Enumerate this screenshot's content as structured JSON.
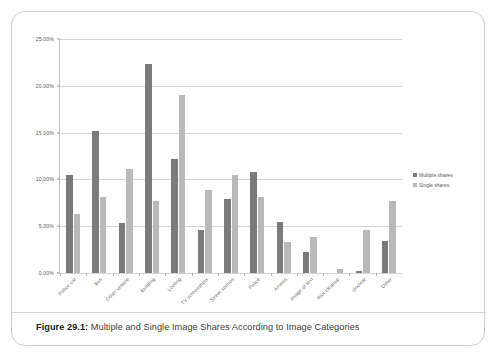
{
  "figure": {
    "number_label": "Figure 29.1:",
    "caption": "Multiple and Single Image Shares According to Image Categories"
  },
  "legend": {
    "position": "right",
    "entries": [
      {
        "label": "Multiple shares",
        "color": "#7b7b7b"
      },
      {
        "label": "Single shares",
        "color": "#b9b9b9"
      }
    ]
  },
  "chart_data": {
    "type": "bar",
    "title": "Multiple and Single Image Shares According to Image Categories",
    "xlabel": "",
    "ylabel": "",
    "ylim": [
      0,
      25
    ],
    "yticks": [
      0,
      5,
      10,
      15,
      20,
      25
    ],
    "ytick_labels": [
      "0.00%",
      "5.00%",
      "10.00%",
      "15.00%",
      "20.00%",
      "25.00%"
    ],
    "grid": true,
    "unit": "%",
    "categories": [
      "Police car",
      "Bus",
      "Other vehicle",
      "Building",
      "Looting",
      "TV screenshots",
      "Street scenes",
      "Police",
      "Arrests",
      "Image of text",
      "Riot cleanup",
      "Unclear",
      "Other"
    ],
    "series": [
      {
        "name": "Multiple shares",
        "color": "#7b7b7b",
        "values": [
          10.5,
          15.2,
          5.3,
          22.3,
          12.2,
          4.6,
          7.9,
          10.8,
          5.5,
          2.2,
          0.0,
          0.2,
          3.4
        ]
      },
      {
        "name": "Single shares",
        "color": "#b9b9b9",
        "values": [
          6.3,
          8.1,
          11.1,
          7.7,
          19.0,
          8.9,
          10.5,
          8.1,
          3.3,
          3.8,
          0.4,
          4.6,
          7.7
        ]
      }
    ]
  }
}
